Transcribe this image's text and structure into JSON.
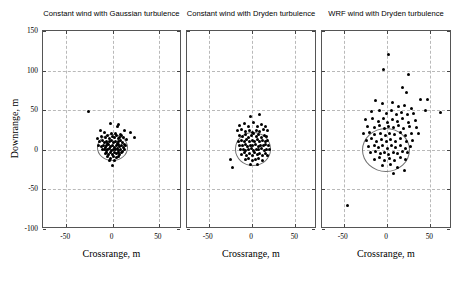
{
  "figure": {
    "width": 456,
    "height": 281,
    "background": "#ffffff",
    "dot_color": "#000000",
    "grid_color": "#b9b9b9",
    "axis_color": "#555555",
    "circle_color": "#707070"
  },
  "axes": {
    "xlabel": "Crossrange, m",
    "ylabel": "Downrange, m",
    "xlim": [
      -75,
      75
    ],
    "ylim": [
      -100,
      150
    ],
    "xticks": [
      -50,
      0,
      50
    ],
    "xtick_labels": [
      "-50",
      "0",
      "50"
    ],
    "yticks": [
      -100,
      -50,
      0,
      50,
      100,
      150
    ],
    "ytick_labels": [
      "-100",
      "-50",
      "0",
      "50",
      "100",
      "150"
    ],
    "grid": true,
    "grid_style": "dashed"
  },
  "chart_data": {
    "type": "scatter",
    "title": "",
    "xlabel": "Crossrange, m",
    "ylabel": "Downrange, m",
    "xlim": [
      -75,
      75
    ],
    "ylim": [
      -100,
      150
    ],
    "xticks": [
      -50,
      0,
      50
    ],
    "yticks": [
      -100,
      -50,
      0,
      50,
      100,
      150
    ],
    "grid": true,
    "legend": "none",
    "panels": [
      {
        "title": "Constant wind with Gaussian turbulence",
        "cep_circle": {
          "cx": 0,
          "cy": 3,
          "r": 17
        },
        "points": [
          [
            -13.0,
            25.0
          ],
          [
            -2.0,
            33.0
          ],
          [
            5.0,
            29.0
          ],
          [
            7.0,
            32.0
          ],
          [
            -9.0,
            22.0
          ],
          [
            -1.0,
            20.0
          ],
          [
            3.0,
            21.0
          ],
          [
            9.0,
            19.0
          ],
          [
            13.0,
            25.0
          ],
          [
            19.0,
            22.0
          ],
          [
            -16.0,
            14.0
          ],
          [
            -12.0,
            17.0
          ],
          [
            -8.0,
            16.0
          ],
          [
            -5.0,
            18.0
          ],
          [
            -3.0,
            14.0
          ],
          [
            0.0,
            17.0
          ],
          [
            2.0,
            15.0
          ],
          [
            4.0,
            18.0
          ],
          [
            6.0,
            14.0
          ],
          [
            8.0,
            16.0
          ],
          [
            10.0,
            18.0
          ],
          [
            12.0,
            15.0
          ],
          [
            15.0,
            13.0
          ],
          [
            -14.0,
            10.0
          ],
          [
            -11.0,
            12.0
          ],
          [
            -9.0,
            9.0
          ],
          [
            -7.0,
            11.0
          ],
          [
            -5.0,
            8.0
          ],
          [
            -3.0,
            10.0
          ],
          [
            -1.0,
            12.0
          ],
          [
            1.0,
            9.0
          ],
          [
            3.0,
            11.0
          ],
          [
            5.0,
            8.0
          ],
          [
            7.0,
            10.0
          ],
          [
            9.0,
            12.0
          ],
          [
            11.0,
            9.0
          ],
          [
            13.0,
            7.0
          ],
          [
            -15.0,
            5.0
          ],
          [
            -12.0,
            4.0
          ],
          [
            -10.0,
            6.0
          ],
          [
            -8.0,
            3.0
          ],
          [
            -6.0,
            5.0
          ],
          [
            -4.0,
            7.0
          ],
          [
            -2.0,
            4.0
          ],
          [
            0.0,
            6.0
          ],
          [
            2.0,
            3.0
          ],
          [
            4.0,
            5.0
          ],
          [
            6.0,
            7.0
          ],
          [
            8.0,
            4.0
          ],
          [
            10.0,
            6.0
          ],
          [
            12.0,
            3.0
          ],
          [
            14.0,
            5.0
          ],
          [
            -11.0,
            0.0
          ],
          [
            -9.0,
            1.0
          ],
          [
            -7.0,
            -1.0
          ],
          [
            -5.0,
            0.0
          ],
          [
            -3.0,
            2.0
          ],
          [
            -1.0,
            -1.0
          ],
          [
            1.0,
            1.0
          ],
          [
            3.0,
            0.0
          ],
          [
            5.0,
            2.0
          ],
          [
            7.0,
            -1.0
          ],
          [
            9.0,
            1.0
          ],
          [
            11.0,
            -2.0
          ],
          [
            13.0,
            0.0
          ],
          [
            -8.0,
            -5.0
          ],
          [
            -6.0,
            -3.0
          ],
          [
            -4.0,
            -6.0
          ],
          [
            -2.0,
            -4.0
          ],
          [
            0.0,
            -6.0
          ],
          [
            2.0,
            -3.0
          ],
          [
            4.0,
            -5.0
          ],
          [
            6.0,
            -4.0
          ],
          [
            8.0,
            -6.0
          ],
          [
            10.0,
            -4.0
          ],
          [
            -5.0,
            -9.0
          ],
          [
            -2.0,
            -11.0
          ],
          [
            1.0,
            -9.0
          ],
          [
            4.0,
            -10.0
          ],
          [
            7.0,
            -8.0
          ],
          [
            -3.0,
            -14.0
          ],
          [
            2.0,
            -13.0
          ],
          [
            0.0,
            -20.0
          ],
          [
            24.0,
            16.0
          ],
          [
            -26.0,
            48.0
          ]
        ]
      },
      {
        "title": "Constant wind with Dryden turbulence",
        "cep_circle": {
          "cx": 1,
          "cy": 1,
          "r": 21
        },
        "points": [
          [
            -2.0,
            42.0
          ],
          [
            9.0,
            44.0
          ],
          [
            -14.0,
            31.0
          ],
          [
            -9.0,
            33.0
          ],
          [
            -4.0,
            30.0
          ],
          [
            2.0,
            34.0
          ],
          [
            6.0,
            29.0
          ],
          [
            11.0,
            32.0
          ],
          [
            16.0,
            30.0
          ],
          [
            -17.0,
            24.0
          ],
          [
            -12.0,
            26.0
          ],
          [
            -7.0,
            23.0
          ],
          [
            -3.0,
            25.0
          ],
          [
            1.0,
            22.0
          ],
          [
            5.0,
            25.0
          ],
          [
            9.0,
            23.0
          ],
          [
            13.0,
            26.0
          ],
          [
            18.0,
            24.0
          ],
          [
            -15.0,
            18.0
          ],
          [
            -11.0,
            17.0
          ],
          [
            -7.0,
            19.0
          ],
          [
            -4.0,
            16.0
          ],
          [
            -1.0,
            18.0
          ],
          [
            2.0,
            20.0
          ],
          [
            5.0,
            17.0
          ],
          [
            8.0,
            19.0
          ],
          [
            11.0,
            16.0
          ],
          [
            14.0,
            18.0
          ],
          [
            17.0,
            17.0
          ],
          [
            -16.0,
            11.0
          ],
          [
            -12.0,
            12.0
          ],
          [
            -9.0,
            10.0
          ],
          [
            -6.0,
            13.0
          ],
          [
            -3.0,
            11.0
          ],
          [
            0.0,
            12.0
          ],
          [
            3.0,
            10.0
          ],
          [
            6.0,
            13.0
          ],
          [
            9.0,
            11.0
          ],
          [
            12.0,
            12.0
          ],
          [
            15.0,
            10.0
          ],
          [
            18.0,
            12.0
          ],
          [
            -14.0,
            6.0
          ],
          [
            -11.0,
            5.0
          ],
          [
            -8.0,
            7.0
          ],
          [
            -5.0,
            4.0
          ],
          [
            -2.0,
            6.0
          ],
          [
            1.0,
            5.0
          ],
          [
            4.0,
            7.0
          ],
          [
            7.0,
            4.0
          ],
          [
            10.0,
            6.0
          ],
          [
            13.0,
            5.0
          ],
          [
            16.0,
            7.0
          ],
          [
            19.0,
            5.0
          ],
          [
            -13.0,
            0.0
          ],
          [
            -10.0,
            1.0
          ],
          [
            -7.0,
            -1.0
          ],
          [
            -4.0,
            0.0
          ],
          [
            -1.0,
            2.0
          ],
          [
            2.0,
            -1.0
          ],
          [
            5.0,
            1.0
          ],
          [
            8.0,
            0.0
          ],
          [
            11.0,
            2.0
          ],
          [
            14.0,
            -1.0
          ],
          [
            17.0,
            1.0
          ],
          [
            20.0,
            0.0
          ],
          [
            -12.0,
            -6.0
          ],
          [
            -9.0,
            -4.0
          ],
          [
            -6.0,
            -7.0
          ],
          [
            -3.0,
            -5.0
          ],
          [
            0.0,
            -7.0
          ],
          [
            3.0,
            -4.0
          ],
          [
            6.0,
            -6.0
          ],
          [
            9.0,
            -5.0
          ],
          [
            12.0,
            -7.0
          ],
          [
            15.0,
            -5.0
          ],
          [
            18.0,
            -7.0
          ],
          [
            -8.0,
            -12.0
          ],
          [
            -4.0,
            -11.0
          ],
          [
            0.0,
            -13.0
          ],
          [
            4.0,
            -12.0
          ],
          [
            8.0,
            -11.0
          ],
          [
            12.0,
            -13.0
          ],
          [
            -2.0,
            -19.0
          ],
          [
            6.0,
            -18.0
          ],
          [
            -22.0,
            -22.0
          ],
          [
            -25.0,
            -12.0
          ]
        ]
      },
      {
        "title": "WRF wind with Dryden turbulence",
        "cep_circle": {
          "cx": -1,
          "cy": 0,
          "r": 28
        },
        "points": [
          [
            2.0,
            120.0
          ],
          [
            25.0,
            95.0
          ],
          [
            -4.0,
            101.0
          ],
          [
            18.0,
            79.0
          ],
          [
            22.0,
            72.0
          ],
          [
            47.0,
            64.0
          ],
          [
            39.0,
            63.0
          ],
          [
            -13.0,
            62.0
          ],
          [
            -5.0,
            58.0
          ],
          [
            6.0,
            60.0
          ],
          [
            13.0,
            55.0
          ],
          [
            20.0,
            56.0
          ],
          [
            28.0,
            52.0
          ],
          [
            -18.0,
            48.0
          ],
          [
            -9.0,
            50.0
          ],
          [
            -1.0,
            46.0
          ],
          [
            5.0,
            49.0
          ],
          [
            11.0,
            45.0
          ],
          [
            17.0,
            47.0
          ],
          [
            24.0,
            44.0
          ],
          [
            31.0,
            46.0
          ],
          [
            -25.0,
            38.0
          ],
          [
            -17.0,
            40.0
          ],
          [
            -10.0,
            36.0
          ],
          [
            -4.0,
            39.0
          ],
          [
            1.0,
            35.0
          ],
          [
            6.0,
            38.0
          ],
          [
            12.0,
            36.0
          ],
          [
            18.0,
            39.0
          ],
          [
            25.0,
            35.0
          ],
          [
            33.0,
            37.0
          ],
          [
            -22.0,
            30.0
          ],
          [
            -15.0,
            28.0
          ],
          [
            -9.0,
            31.0
          ],
          [
            -3.0,
            27.0
          ],
          [
            2.0,
            30.0
          ],
          [
            7.0,
            28.0
          ],
          [
            13.0,
            31.0
          ],
          [
            19.0,
            27.0
          ],
          [
            26.0,
            29.0
          ],
          [
            34.0,
            28.0
          ],
          [
            -27.0,
            20.0
          ],
          [
            -20.0,
            22.0
          ],
          [
            -14.0,
            19.0
          ],
          [
            -8.0,
            21.0
          ],
          [
            -2.0,
            18.0
          ],
          [
            3.0,
            21.0
          ],
          [
            9.0,
            19.0
          ],
          [
            15.0,
            22.0
          ],
          [
            21.0,
            18.0
          ],
          [
            28.0,
            20.0
          ],
          [
            36.0,
            21.0
          ],
          [
            -24.0,
            12.0
          ],
          [
            -18.0,
            14.0
          ],
          [
            -12.0,
            11.0
          ],
          [
            -6.0,
            13.0
          ],
          [
            -1.0,
            10.0
          ],
          [
            4.0,
            13.0
          ],
          [
            10.0,
            11.0
          ],
          [
            16.0,
            14.0
          ],
          [
            22.0,
            10.0
          ],
          [
            29.0,
            12.0
          ],
          [
            -21.0,
            4.0
          ],
          [
            -15.0,
            6.0
          ],
          [
            -10.0,
            3.0
          ],
          [
            -5.0,
            5.0
          ],
          [
            0.0,
            2.0
          ],
          [
            5.0,
            5.0
          ],
          [
            10.0,
            3.0
          ],
          [
            15.0,
            6.0
          ],
          [
            21.0,
            2.0
          ],
          [
            27.0,
            4.0
          ],
          [
            -19.0,
            -4.0
          ],
          [
            -13.0,
            -2.0
          ],
          [
            -8.0,
            -5.0
          ],
          [
            -3.0,
            -3.0
          ],
          [
            2.0,
            -6.0
          ],
          [
            7.0,
            -3.0
          ],
          [
            12.0,
            -5.0
          ],
          [
            18.0,
            -2.0
          ],
          [
            24.0,
            -4.0
          ],
          [
            -15.0,
            -12.0
          ],
          [
            -9.0,
            -10.0
          ],
          [
            -3.0,
            -13.0
          ],
          [
            3.0,
            -11.0
          ],
          [
            9.0,
            -13.0
          ],
          [
            15.0,
            -10.0
          ],
          [
            21.0,
            -12.0
          ],
          [
            -5.0,
            -20.0
          ],
          [
            4.0,
            -19.0
          ],
          [
            12.0,
            -22.0
          ],
          [
            20.0,
            -26.0
          ],
          [
            8.0,
            -30.0
          ],
          [
            -46.0,
            -70.0
          ],
          [
            62.0,
            47.0
          ],
          [
            44.0,
            49.0
          ]
        ]
      }
    ]
  }
}
